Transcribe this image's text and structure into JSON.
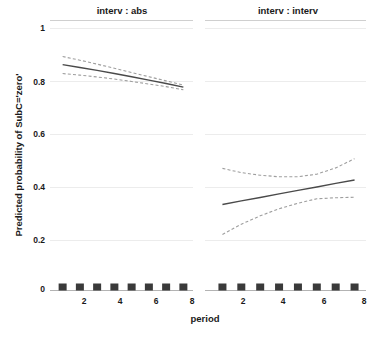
{
  "chart_data": {
    "type": "line",
    "title": "",
    "subtitle": "",
    "xlabel": "period",
    "ylabel": "Predicted probability of SubC='zero'",
    "xlim": [
      0.5,
      8.5
    ],
    "ylim": [
      0,
      1
    ],
    "grid": true,
    "grid_axis": "y",
    "legend": "none",
    "legend_position": "none",
    "panel_layout": "1x2",
    "y_ticks": [
      0,
      0.2,
      0.4,
      0.6,
      0.8,
      1
    ],
    "y_tick_labels": [
      "0",
      "0.2",
      "0.4",
      "0.6",
      "0.8",
      "1"
    ],
    "x_ticks": [
      2,
      4,
      6,
      8
    ],
    "x_tick_labels": [
      "2",
      "4",
      "6",
      "8"
    ],
    "rug_x": [
      1,
      2,
      3,
      4,
      5,
      6,
      7,
      8
    ],
    "panels": [
      {
        "strip_label": "interv : abs",
        "x": [
          1,
          2,
          3,
          4,
          5,
          6,
          7,
          8
        ],
        "series": [
          {
            "name": "fit",
            "style": "solid",
            "values": [
              0.862,
              0.851,
              0.84,
              0.828,
              0.816,
              0.803,
              0.79,
              0.776
            ]
          },
          {
            "name": "upper",
            "style": "dashed",
            "values": [
              0.893,
              0.879,
              0.864,
              0.848,
              0.832,
              0.816,
              0.8,
              0.784
            ]
          },
          {
            "name": "lower",
            "style": "dashed",
            "values": [
              0.828,
              0.822,
              0.815,
              0.807,
              0.798,
              0.788,
              0.778,
              0.766
            ]
          }
        ]
      },
      {
        "strip_label": "interv : interv",
        "x": [
          1,
          2,
          3,
          4,
          5,
          6,
          7,
          8
        ],
        "series": [
          {
            "name": "fit",
            "style": "solid",
            "values": [
              0.328,
              0.342,
              0.355,
              0.369,
              0.382,
              0.395,
              0.409,
              0.422
            ]
          },
          {
            "name": "upper",
            "style": "dashed",
            "values": [
              0.466,
              0.45,
              0.44,
              0.434,
              0.434,
              0.444,
              0.468,
              0.503
            ]
          },
          {
            "name": "lower",
            "style": "dashed",
            "values": [
              0.214,
              0.253,
              0.285,
              0.312,
              0.333,
              0.35,
              0.354,
              0.356
            ]
          }
        ]
      }
    ]
  },
  "figure": {
    "y_axis_title": "Predicted probability of SubC='zero'",
    "x_axis_title": "period",
    "panel_left_title": "interv : abs",
    "panel_right_title": "interv : interv",
    "ytick_0": "0",
    "ytick_02": "0.2",
    "ytick_04": "0.4",
    "ytick_06": "0.6",
    "ytick_08": "0.8",
    "ytick_1": "1",
    "xtick_2_left": "2",
    "xtick_4_left": "4",
    "xtick_6_left": "6",
    "xtick_8_left": "8",
    "xtick_2_right": "2",
    "xtick_4_right": "4",
    "xtick_6_right": "6",
    "xtick_8_right": "8"
  },
  "colors": {
    "line_solid": "#4a4a4a",
    "line_dashed": "#9a9a9a",
    "grid": "#e8e8e8",
    "axis": "#b0b0b0",
    "rug": "#3a3a3a",
    "text": "#1a1a1a",
    "background": "#ffffff"
  }
}
